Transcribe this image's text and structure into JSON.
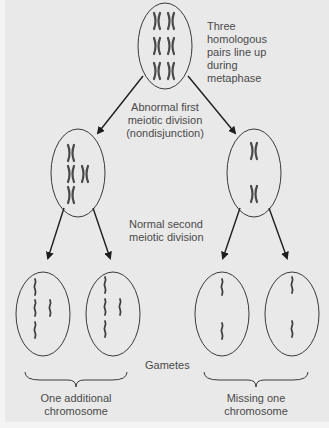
{
  "diagram": {
    "type": "meiosis-nondisjunction",
    "colors": {
      "background": "#e9e9e9",
      "outline": "#3a3a3a",
      "chromosome": "#4a4a4a",
      "text": "#4a4a4a"
    },
    "labels": {
      "metaphase": [
        "Three",
        "homologous",
        "pairs line up",
        "during",
        "metaphase"
      ],
      "first_division": [
        "Abnormal first",
        "meiotic division",
        "(nondisjunction)"
      ],
      "second_division": [
        "Normal second",
        "meiotic division"
      ],
      "gametes": "Gametes",
      "left_group": [
        "One additional",
        "chromosome"
      ],
      "right_group": [
        "Missing one",
        "chromosome"
      ]
    },
    "cells": {
      "parent": {
        "chromosomes": "3 pairs of X-shaped homologs (6 X)"
      },
      "daughter_left": {
        "chromosomes": "4 X-shaped chromosomes"
      },
      "daughter_right": {
        "chromosomes": "2 X-shaped chromosomes"
      },
      "gametes": [
        {
          "group": "One additional chromosome",
          "chromatids": 4
        },
        {
          "group": "One additional chromosome",
          "chromatids": 4
        },
        {
          "group": "Missing one chromosome",
          "chromatids": 2
        },
        {
          "group": "Missing one chromosome",
          "chromatids": 2
        }
      ]
    }
  }
}
